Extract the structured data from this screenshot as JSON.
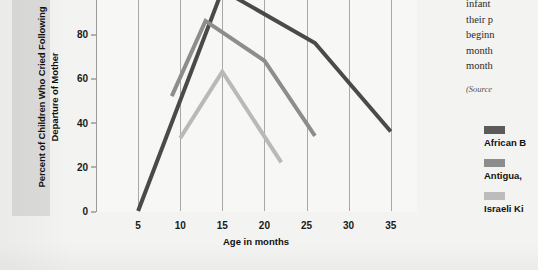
{
  "chart_data": {
    "type": "line",
    "title": "",
    "xlabel": "Age in months",
    "ylabel": "Percent of Children Who Cried Following Departure of Mother",
    "xlim": [
      0,
      38
    ],
    "ylim": [
      0,
      100
    ],
    "xticks": [
      5,
      10,
      15,
      20,
      25,
      30,
      35
    ],
    "yticks": [
      0,
      20,
      40,
      60,
      80,
      100
    ],
    "grid": "vertical",
    "legend_position": "right",
    "series": [
      {
        "name": "African Bushmen",
        "color": "#4a4a4a",
        "x": [
          5,
          15,
          26,
          35
        ],
        "y": [
          0,
          100,
          76,
          36
        ]
      },
      {
        "name": "Antigua, Guatemala",
        "color": "#8d8d8d",
        "x": [
          9,
          13,
          20,
          26
        ],
        "y": [
          52,
          86,
          68,
          34
        ]
      },
      {
        "name": "Israeli Kibbutz",
        "color": "#b9b9b9",
        "x": [
          10,
          15,
          22
        ],
        "y": [
          33,
          63,
          22
        ]
      }
    ]
  },
  "legend": {
    "entries": [
      {
        "label": "African B",
        "color": "#5b5b5b"
      },
      {
        "label": "Antigua,",
        "color": "#8d8d8d"
      },
      {
        "label": "Israeli Ki",
        "color": "#bcbcbc"
      }
    ]
  },
  "bodycopy": {
    "lines": [
      "infant",
      "their p",
      "beginn",
      "month",
      "month"
    ]
  },
  "source": {
    "text": "(Source"
  }
}
